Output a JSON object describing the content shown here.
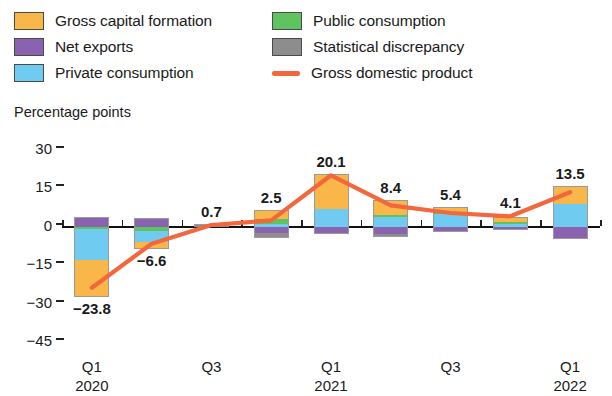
{
  "axis_title": "Percentage points",
  "legend": {
    "column1": [
      {
        "label": "Gross capital formation",
        "color": "#f8b councils"
      },
      {
        "label": "Net exports",
        "color": "#8a63b0"
      },
      {
        "label": "Private consumption",
        "color": "#6fcbef"
      }
    ],
    "column2": [
      {
        "label": "Public consumption",
        "color": "#5fc35f"
      },
      {
        "label": "Statistical discrepancy",
        "color": "#8d8d8d"
      },
      {
        "label": "Gross domestic product",
        "color": "#f4673c",
        "type": "line"
      }
    ]
  },
  "chart_data": {
    "type": "bar",
    "subtype": "stacked-bar-with-line",
    "title": "",
    "ylabel": "Percentage points",
    "xlabel": "",
    "ylim": [
      -45,
      30
    ],
    "yticks": [
      30,
      15,
      0,
      -15,
      -30,
      -45
    ],
    "grid": false,
    "legend_position": "top",
    "categories": [
      "Q1\n2020",
      "Q2",
      "Q3",
      "Q4",
      "Q1\n2021",
      "Q2",
      "Q3",
      "Q4",
      "Q1\n2022"
    ],
    "xtick_labels": [
      {
        "index": 0,
        "label": "Q1",
        "sublabel": "2020"
      },
      {
        "index": 2,
        "label": "Q3",
        "sublabel": ""
      },
      {
        "index": 4,
        "label": "Q1",
        "sublabel": "2021"
      },
      {
        "index": 6,
        "label": "Q3",
        "sublabel": ""
      },
      {
        "index": 8,
        "label": "Q1",
        "sublabel": "2022"
      }
    ],
    "series": [
      {
        "name": "Gross capital formation",
        "color": "#f9b74a",
        "values": [
          -14.2,
          -2.1,
          0.0,
          3.4,
          13.0,
          5.4,
          2.0,
          1.4,
          6.6
        ]
      },
      {
        "name": "Private consumption",
        "color": "#6fcbef",
        "values": [
          -12.0,
          -4.5,
          0.0,
          0.9,
          7.1,
          3.8,
          4.9,
          1.2,
          8.8
        ]
      },
      {
        "name": "Public consumption",
        "color": "#5fc35f",
        "values": [
          -1.0,
          -1.5,
          0.0,
          2.0,
          0.0,
          0.9,
          0.3,
          0.8,
          0.0
        ]
      },
      {
        "name": "Net exports",
        "color": "#8a63b0",
        "values": [
          3.4,
          3.0,
          0.0,
          -2.4,
          -2.3,
          -2.9,
          -1.8,
          -0.8,
          -4.2
        ]
      },
      {
        "name": "Statistical discrepancy",
        "color": "#8d8d8d",
        "values": [
          0.0,
          0.0,
          0.7,
          -1.4,
          0.0,
          -0.8,
          0.0,
          0.0,
          0.0
        ]
      }
    ],
    "line_series": {
      "name": "Gross domestic product",
      "color": "#f4673c",
      "values": [
        -23.8,
        -6.6,
        0.7,
        2.5,
        20.1,
        8.4,
        5.4,
        4.1,
        13.5
      ]
    },
    "value_labels": [
      {
        "index": 0,
        "text": "−23.8"
      },
      {
        "index": 1,
        "text": "−6.6"
      },
      {
        "index": 2,
        "text": "0.7"
      },
      {
        "index": 3,
        "text": "2.5"
      },
      {
        "index": 4,
        "text": "20.1"
      },
      {
        "index": 5,
        "text": "8.4"
      },
      {
        "index": 6,
        "text": "5.4"
      },
      {
        "index": 7,
        "text": "4.1"
      },
      {
        "index": 8,
        "text": "13.5"
      }
    ]
  }
}
